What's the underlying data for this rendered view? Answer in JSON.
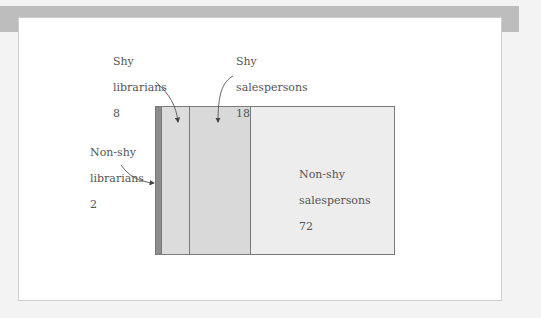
{
  "diagram": {
    "type": "area-proportion",
    "total": 100,
    "segments": [
      {
        "id": "non-shy-librarians",
        "line1": "Non-shy",
        "line2": "librarians",
        "value": 2,
        "color": "#8c8c8c"
      },
      {
        "id": "shy-librarians",
        "line1": "Shy",
        "line2": "librarians",
        "value": 8,
        "color": "#dcdcdc"
      },
      {
        "id": "shy-salespersons",
        "line1": "Shy",
        "line2": "salespersons",
        "value": 18,
        "color": "#d9d9d9"
      },
      {
        "id": "non-shy-salespersons",
        "line1": "Non-shy",
        "line2": "salespersons",
        "value": 72,
        "color": "#ededed"
      }
    ],
    "labels": {
      "shy_librarians": {
        "line1": "Shy",
        "line2": "librarians",
        "value": "8"
      },
      "shy_salespersons": {
        "line1": "Shy",
        "line2": "salespersons",
        "value": "18"
      },
      "non_shy_librarians": {
        "line1": "Non-shy",
        "line2": "librarians",
        "value": "2"
      },
      "non_shy_salespersons": {
        "line1": "Non-shy",
        "line2": "salespersons",
        "value": "72"
      }
    }
  }
}
